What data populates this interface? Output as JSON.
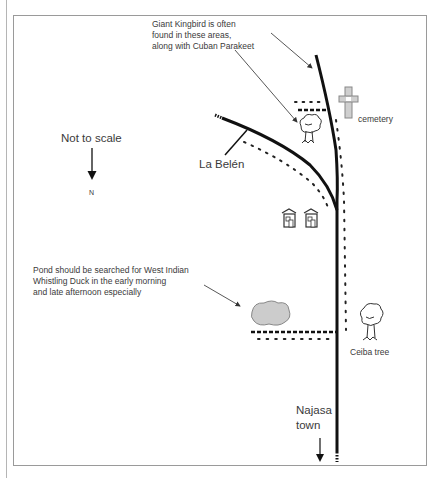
{
  "map": {
    "annotations": {
      "kingbird_note": [
        "Giant Kingbird is often",
        "found in these areas,",
        "along with Cuban Parakeet"
      ],
      "pond_note": [
        "Pond should be searched for West Indian",
        "Whistling Duck in the early morning",
        "and late afternoon especially"
      ]
    },
    "scale_note": "Not to scale",
    "north_label": "N",
    "places": {
      "la_belen": "La Belén",
      "cemetery": "cemetery",
      "ceiba_tree": "Ceiba tree",
      "najasa_town_line1": "Najasa",
      "najasa_town_line2": "town"
    },
    "icons": [
      "cross-icon",
      "tree-icon",
      "house-icon",
      "house-icon",
      "pond-shape",
      "tree-icon"
    ],
    "colors": {
      "road": "#111111",
      "text": "#3a3a3a",
      "frame": "#9a9a9a",
      "pond_fill": "#cccccc",
      "cross_fill": "#cfcfcf"
    }
  }
}
